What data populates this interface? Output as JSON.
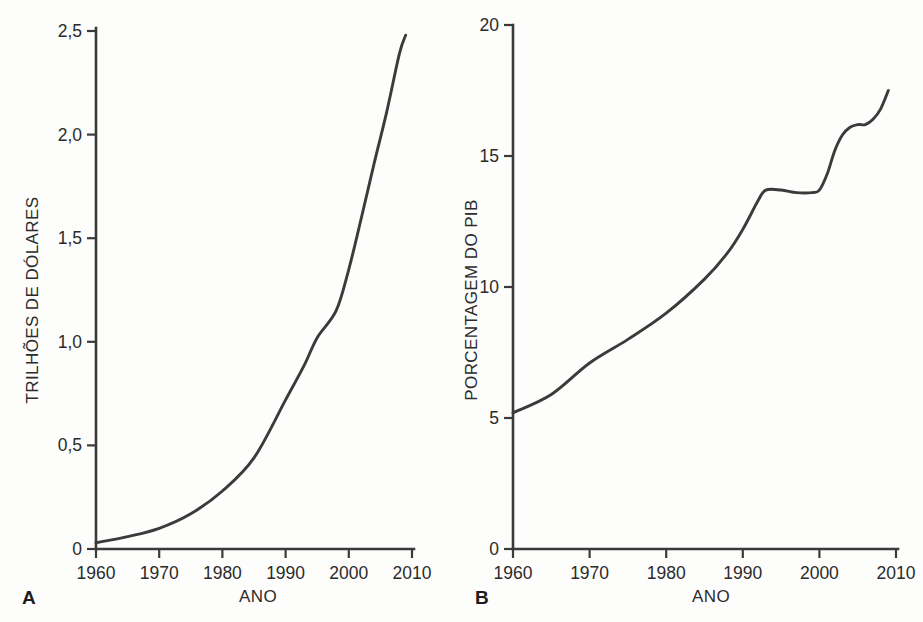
{
  "figure": {
    "background_color": "#fdfdfc",
    "line_color": "#3b3b3b",
    "text_color": "#2b2b2b"
  },
  "panels": {
    "a": {
      "letter": "A",
      "ylabel": "TRILHÕES DE DÓLARES",
      "xlabel": "ANO",
      "y_ticks": [
        "0",
        "0,5",
        "1,0",
        "1,5",
        "2,0",
        "2,5"
      ],
      "x_ticks": [
        "1960",
        "1970",
        "1980",
        "1990",
        "2000",
        "2010"
      ]
    },
    "b": {
      "letter": "B",
      "ylabel": "PORCENTAGEM DO PIB",
      "xlabel": "ANO",
      "y_ticks": [
        "0",
        "5",
        "10",
        "15",
        "20"
      ],
      "x_ticks": [
        "1960",
        "1970",
        "1980",
        "1990",
        "2000",
        "2010"
      ]
    }
  },
  "chart_data": [
    {
      "id": "panel-a",
      "type": "line",
      "title": "",
      "panel_label": "A",
      "xlabel": "ANO",
      "ylabel": "TRILHÕES DE DÓLARES",
      "xlim": [
        1960,
        2010
      ],
      "ylim": [
        0,
        2.5
      ],
      "xticks": [
        1960,
        1970,
        1980,
        1990,
        2000,
        2010
      ],
      "xticklabels": [
        "1960",
        "1970",
        "1980",
        "1990",
        "2000",
        "2010"
      ],
      "yticks": [
        0,
        0.5,
        1.0,
        1.5,
        2.0,
        2.5
      ],
      "yticklabels": [
        "0",
        "0,5",
        "1,0",
        "1,5",
        "2,0",
        "2,5"
      ],
      "grid": false,
      "legend": false,
      "series": [
        {
          "name": "Gastos com saúde (trilhões de dólares)",
          "x": [
            1960,
            1965,
            1970,
            1975,
            1980,
            1985,
            1990,
            1993,
            1995,
            1998,
            2000,
            2002,
            2004,
            2006,
            2008,
            2009
          ],
          "values": [
            0.03,
            0.06,
            0.1,
            0.17,
            0.28,
            0.44,
            0.72,
            0.89,
            1.02,
            1.15,
            1.35,
            1.6,
            1.86,
            2.11,
            2.39,
            2.48
          ]
        }
      ]
    },
    {
      "id": "panel-b",
      "type": "line",
      "title": "",
      "panel_label": "B",
      "xlabel": "ANO",
      "ylabel": "PORCENTAGEM DO PIB",
      "xlim": [
        1960,
        2010
      ],
      "ylim": [
        0,
        20
      ],
      "xticks": [
        1960,
        1970,
        1980,
        1990,
        2000,
        2010
      ],
      "xticklabels": [
        "1960",
        "1970",
        "1980",
        "1990",
        "2000",
        "2010"
      ],
      "yticks": [
        0,
        5,
        10,
        15,
        20
      ],
      "yticklabels": [
        "0",
        "5",
        "10",
        "15",
        "20"
      ],
      "grid": false,
      "legend": false,
      "series": [
        {
          "name": "Gastos com saúde (% do PIB)",
          "x": [
            1960,
            1965,
            1970,
            1975,
            1980,
            1985,
            1988,
            1990,
            1992,
            1993,
            1995,
            1997,
            1999,
            2000,
            2001,
            2002,
            2003,
            2004,
            2005,
            2006,
            2007,
            2008,
            2009
          ],
          "values": [
            5.2,
            5.9,
            7.1,
            8.0,
            9.0,
            10.3,
            11.3,
            12.2,
            13.3,
            13.7,
            13.7,
            13.6,
            13.6,
            13.7,
            14.3,
            15.2,
            15.8,
            16.1,
            16.2,
            16.2,
            16.4,
            16.8,
            17.5
          ]
        }
      ]
    }
  ]
}
